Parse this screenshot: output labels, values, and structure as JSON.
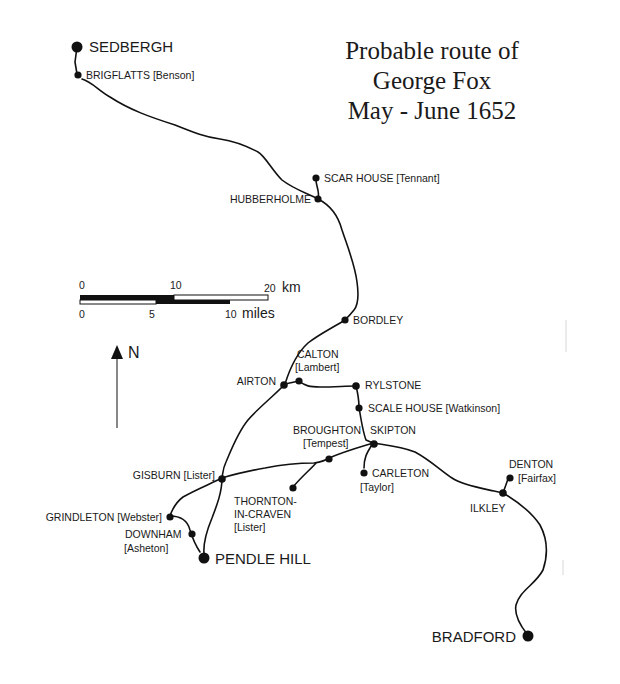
{
  "title": {
    "line1": "Probable route of",
    "line2": "George Fox",
    "line3": "May - June 1652"
  },
  "scale": {
    "km_ticks": [
      "0",
      "10",
      "20"
    ],
    "km_unit": "km",
    "miles_ticks": [
      "0",
      "5",
      "10"
    ],
    "miles_unit": "miles"
  },
  "north_arrow": {
    "label": "N"
  },
  "places": {
    "sedbergh": "SEDBERGH",
    "brigflatts": "BRIGFLATTS [Benson]",
    "scar_house": "SCAR HOUSE [Tennant]",
    "hubberholme": "HUBBERHOLME",
    "bordley": "BORDLEY",
    "calton_1": "CALTON",
    "calton_2": "[Lambert]",
    "airton": "AIRTON",
    "rylstone": "RYLSTONE",
    "scale_house": "SCALE HOUSE [Watkinson]",
    "broughton_1": "BROUGHTON",
    "broughton_2": "[Tempest]",
    "skipton": "SKIPTON",
    "carleton_1": "CARLETON",
    "carleton_2": "[Taylor]",
    "gisburn": "GISBURN [Lister]",
    "thornton_1": "THORNTON-",
    "thornton_2": "IN-CRAVEN",
    "thornton_3": "[Lister]",
    "grindleton": "GRINDLETON [Webster]",
    "downham_1": "DOWNHAM",
    "downham_2": "[Asheton]",
    "pendle_hill": "PENDLE HILL",
    "denton_1": "DENTON",
    "denton_2": "[Fairfax]",
    "ilkley": "ILKLEY",
    "bradford": "BRADFORD"
  },
  "colors": {
    "ink": "#111111",
    "background": "#ffffff"
  }
}
